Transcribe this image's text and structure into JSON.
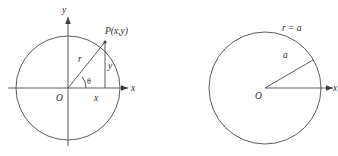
{
  "figure": {
    "caption": "",
    "background_color": "#ffffff",
    "stroke_color": "#4a4a4a",
    "text_color": "#2b2b2b"
  },
  "left_diagram": {
    "name": "polar-point-diagram",
    "axis_x_label": "x",
    "axis_y_label": "y",
    "origin_label": "O",
    "point_label": "P(x,y)",
    "radius_label": "r",
    "angle_label": "θ",
    "leg_vertical_label": "y",
    "leg_horizontal_label": "x",
    "circle": {
      "center_x": 68,
      "center_y": 88,
      "radius": 52
    },
    "point": {
      "x": 105,
      "y": 42
    }
  },
  "right_diagram": {
    "name": "circle-r-equals-a-diagram",
    "axis_x_label": "x",
    "origin_label": "O",
    "curve_equation_label": "r = a",
    "radius_label": "a",
    "circle": {
      "center_x": 265,
      "center_y": 88,
      "radius": 56
    }
  }
}
